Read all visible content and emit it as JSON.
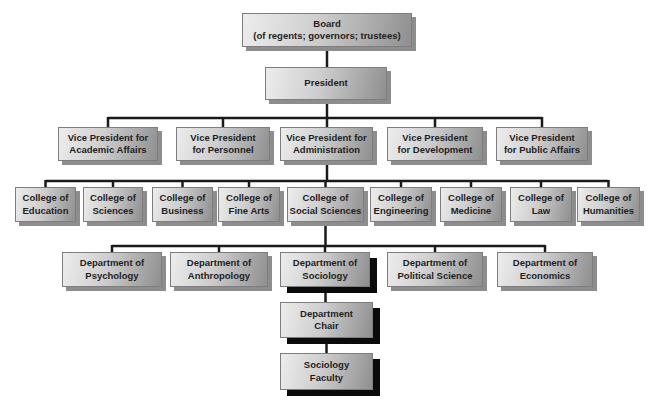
{
  "colors": {
    "background": "#ffffff",
    "box_gradient_start": "#ededed",
    "box_gradient_end": "#8f8f8f",
    "box_border": "#7e7e7e",
    "shadow_normal": "#8d8d8d",
    "shadow_emphasis": "#0b0b0b",
    "connector": "#1a1a1a",
    "text": "#1f1f1f"
  },
  "org_chart": {
    "board": {
      "label": "Board\n(of regents; governors; trustees)"
    },
    "president": {
      "label": "President"
    },
    "vice_presidents": [
      {
        "label": "Vice President for\nAcademic Affairs"
      },
      {
        "label": "Vice President\nfor Personnel"
      },
      {
        "label": "Vice President for\nAdministration"
      },
      {
        "label": "Vice President\nfor Development"
      },
      {
        "label": "Vice President\nfor Public Affairs"
      }
    ],
    "colleges": [
      {
        "label": "College of\nEducation"
      },
      {
        "label": "College of\nSciences"
      },
      {
        "label": "College of\nBusiness"
      },
      {
        "label": "College of\nFine Arts"
      },
      {
        "label": "College of\nSocial Sciences"
      },
      {
        "label": "College of\nEngineering"
      },
      {
        "label": "College of\nMedicine"
      },
      {
        "label": "College of\nLaw"
      },
      {
        "label": "College of\nHumanities"
      }
    ],
    "departments": [
      {
        "label": "Department of\nPsychology",
        "emphasis": false
      },
      {
        "label": "Department of\nAnthropology",
        "emphasis": false
      },
      {
        "label": "Department of\nSociology",
        "emphasis": true
      },
      {
        "label": "Department of\nPolitical Science",
        "emphasis": false
      },
      {
        "label": "Department of\nEconomics",
        "emphasis": false
      }
    ],
    "department_chair": {
      "label": "Department\nChair",
      "emphasis": true
    },
    "sociology_faculty": {
      "label": "Sociology\nFaculty",
      "emphasis": true
    }
  }
}
